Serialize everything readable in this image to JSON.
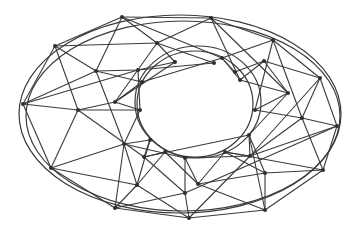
{
  "diagram": {
    "type": "network-graph",
    "layout": "concentric-elliptical-rings",
    "colors": {
      "background": "#ffffff",
      "edge": "#3a3a3a",
      "node": "#2e2e2e"
    },
    "rings": [
      {
        "name": "outer-ellipse-a",
        "cx": 180,
        "cy": 114,
        "rx": 161,
        "ry": 99
      },
      {
        "name": "outer-ellipse-b",
        "cx": 183,
        "cy": 116,
        "rx": 157,
        "ry": 95
      },
      {
        "name": "inner-ellipse-a",
        "cx": 198,
        "cy": 102,
        "rx": 63,
        "ry": 56
      },
      {
        "name": "inner-ellipse-b",
        "cx": 195,
        "cy": 104,
        "rx": 58,
        "ry": 53
      }
    ],
    "nodes": [
      {
        "id": "o1",
        "x": 122,
        "y": 17
      },
      {
        "id": "o2",
        "x": 211,
        "y": 18
      },
      {
        "id": "o3",
        "x": 273,
        "y": 40
      },
      {
        "id": "o4",
        "x": 320,
        "y": 78
      },
      {
        "id": "o5",
        "x": 337,
        "y": 126
      },
      {
        "id": "o6",
        "x": 323,
        "y": 170
      },
      {
        "id": "o7",
        "x": 265,
        "y": 210
      },
      {
        "id": "o8",
        "x": 189,
        "y": 218
      },
      {
        "id": "o9",
        "x": 115,
        "y": 208
      },
      {
        "id": "o10",
        "x": 51,
        "y": 168
      },
      {
        "id": "o11",
        "x": 23,
        "y": 104
      },
      {
        "id": "o12",
        "x": 55,
        "y": 46
      },
      {
        "id": "m1",
        "x": 157,
        "y": 43
      },
      {
        "id": "m2",
        "x": 264,
        "y": 61
      },
      {
        "id": "m3",
        "x": 302,
        "y": 118
      },
      {
        "id": "m4",
        "x": 265,
        "y": 173
      },
      {
        "id": "m5",
        "x": 185,
        "y": 193
      },
      {
        "id": "m6",
        "x": 137,
        "y": 185
      },
      {
        "id": "m7",
        "x": 78,
        "y": 110
      },
      {
        "id": "m8",
        "x": 96,
        "y": 71
      },
      {
        "id": "i1",
        "x": 138,
        "y": 70
      },
      {
        "id": "i2",
        "x": 222,
        "y": 58
      },
      {
        "id": "i3",
        "x": 288,
        "y": 93
      },
      {
        "id": "i4",
        "x": 250,
        "y": 156
      },
      {
        "id": "i5",
        "x": 198,
        "y": 184
      },
      {
        "id": "i6",
        "x": 124,
        "y": 144
      },
      {
        "id": "i7",
        "x": 115,
        "y": 102
      },
      {
        "id": "i8",
        "x": 144,
        "y": 157
      },
      {
        "id": "c1",
        "x": 175,
        "y": 62
      },
      {
        "id": "c2",
        "x": 214,
        "y": 63
      },
      {
        "id": "c3",
        "x": 240,
        "y": 80
      },
      {
        "id": "c4",
        "x": 255,
        "y": 110
      },
      {
        "id": "c5",
        "x": 249,
        "y": 135
      },
      {
        "id": "c6",
        "x": 225,
        "y": 152
      },
      {
        "id": "c7",
        "x": 185,
        "y": 158
      },
      {
        "id": "c8",
        "x": 150,
        "y": 140
      },
      {
        "id": "c9",
        "x": 140,
        "y": 110
      },
      {
        "id": "c10",
        "x": 142,
        "y": 82
      },
      {
        "id": "c11",
        "x": 235,
        "y": 72
      },
      {
        "id": "c12",
        "x": 165,
        "y": 152
      }
    ],
    "edges": [
      [
        "o1",
        "o2"
      ],
      [
        "o2",
        "o3"
      ],
      [
        "o3",
        "o4"
      ],
      [
        "o4",
        "o5"
      ],
      [
        "o5",
        "o6"
      ],
      [
        "o6",
        "o7"
      ],
      [
        "o7",
        "o8"
      ],
      [
        "o8",
        "o9"
      ],
      [
        "o9",
        "o10"
      ],
      [
        "o10",
        "o11"
      ],
      [
        "o11",
        "o12"
      ],
      [
        "o12",
        "o1"
      ],
      [
        "o1",
        "m1"
      ],
      [
        "o1",
        "i2"
      ],
      [
        "o1",
        "m8"
      ],
      [
        "o2",
        "m1"
      ],
      [
        "o2",
        "c3"
      ],
      [
        "o2",
        "i3"
      ],
      [
        "o3",
        "i2"
      ],
      [
        "o3",
        "m3"
      ],
      [
        "o3",
        "c4"
      ],
      [
        "o4",
        "m2"
      ],
      [
        "o4",
        "m3"
      ],
      [
        "o4",
        "i4"
      ],
      [
        "o5",
        "m3"
      ],
      [
        "o5",
        "i4"
      ],
      [
        "o5",
        "m5"
      ],
      [
        "o6",
        "m3"
      ],
      [
        "o6",
        "m4"
      ],
      [
        "o6",
        "c6"
      ],
      [
        "o7",
        "m4"
      ],
      [
        "o7",
        "i5"
      ],
      [
        "o7",
        "c5"
      ],
      [
        "o8",
        "m5"
      ],
      [
        "o8",
        "m6"
      ],
      [
        "o8",
        "i4"
      ],
      [
        "o9",
        "m6"
      ],
      [
        "o9",
        "i6"
      ],
      [
        "o9",
        "m5"
      ],
      [
        "o10",
        "m7"
      ],
      [
        "o10",
        "i6"
      ],
      [
        "o10",
        "m6"
      ],
      [
        "o11",
        "m7"
      ],
      [
        "o11",
        "m8"
      ],
      [
        "o11",
        "i1"
      ],
      [
        "o12",
        "m8"
      ],
      [
        "o12",
        "m7"
      ],
      [
        "o12",
        "m1"
      ],
      [
        "m1",
        "c1"
      ],
      [
        "m1",
        "i7"
      ],
      [
        "m1",
        "c2"
      ],
      [
        "m2",
        "c11"
      ],
      [
        "m2",
        "c3"
      ],
      [
        "m2",
        "i3"
      ],
      [
        "m3",
        "c4"
      ],
      [
        "m3",
        "i4"
      ],
      [
        "m4",
        "c5"
      ],
      [
        "m4",
        "i5"
      ],
      [
        "m4",
        "c6"
      ],
      [
        "m5",
        "c7"
      ],
      [
        "m5",
        "i8"
      ],
      [
        "m6",
        "c12"
      ],
      [
        "m6",
        "i6"
      ],
      [
        "m6",
        "c8"
      ],
      [
        "m7",
        "c9"
      ],
      [
        "m7",
        "i7"
      ],
      [
        "m7",
        "i8"
      ],
      [
        "m8",
        "c10"
      ],
      [
        "m8",
        "i1"
      ],
      [
        "m8",
        "i6"
      ],
      [
        "i1",
        "c1"
      ],
      [
        "i1",
        "c9"
      ],
      [
        "i1",
        "c2"
      ],
      [
        "i2",
        "c11"
      ],
      [
        "i2",
        "c3"
      ],
      [
        "i2",
        "c10"
      ],
      [
        "i3",
        "c4"
      ],
      [
        "i3",
        "c3"
      ],
      [
        "i3",
        "c5"
      ],
      [
        "i4",
        "c5"
      ],
      [
        "i4",
        "c6"
      ],
      [
        "i4",
        "c7"
      ],
      [
        "i5",
        "c7"
      ],
      [
        "i5",
        "c6"
      ],
      [
        "i5",
        "c12"
      ],
      [
        "i6",
        "c8"
      ],
      [
        "i6",
        "c9"
      ],
      [
        "i6",
        "c7"
      ],
      [
        "i7",
        "c9"
      ],
      [
        "i7",
        "c10"
      ],
      [
        "i7",
        "c1"
      ],
      [
        "i8",
        "c12"
      ],
      [
        "i8",
        "c8"
      ],
      [
        "i8",
        "c5"
      ]
    ]
  }
}
